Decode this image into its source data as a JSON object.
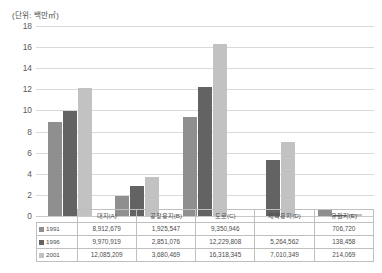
{
  "unit_caption": "(단위: 백만㎡)",
  "chart_data": {
    "type": "bar",
    "title": "",
    "subtitle": "",
    "xlabel": "",
    "ylabel": "",
    "unit": "백만㎡",
    "ylim": [
      0,
      18
    ],
    "ytick_step": 2,
    "yticks": [
      "18",
      "16",
      "14",
      "12",
      "10",
      "8",
      "6",
      "4",
      "2",
      "0"
    ],
    "grid": true,
    "legend_position": "table-row-headers",
    "categories": [
      "대지(A)",
      "공장용지(B)",
      "도로(C)",
      "체육용지(D)",
      "유원지(E)"
    ],
    "series": [
      {
        "name": "1991",
        "color": "#8f8f8f",
        "values": [
          8.912679,
          1.925547,
          9.350946,
          null,
          0.70672
        ],
        "display_values": [
          "8,912,679",
          "1,925,547",
          "9,350,946",
          "",
          "706,720"
        ]
      },
      {
        "name": "1996",
        "color": "#636363",
        "values": [
          9.970919,
          2.851076,
          12.229808,
          5.264562,
          0.138458
        ],
        "display_values": [
          "9,970,919",
          "2,851,076",
          "12,229,808",
          "5,264,562",
          "138,458"
        ]
      },
      {
        "name": "2001",
        "color": "#c2c2c2",
        "values": [
          12.085209,
          3.680469,
          16.318345,
          7.010349,
          0.214069
        ],
        "display_values": [
          "12,085,209",
          "3,680,469",
          "16,318,345",
          "7,010,349",
          "214,069"
        ]
      }
    ]
  },
  "table": {
    "column_headers": [
      "대지(A)",
      "공장용지(B)",
      "도로(C)",
      "체육용지(D)",
      "유원지(E)"
    ],
    "rows": [
      {
        "year": "1991",
        "swatch_class": "s0",
        "cells": [
          "8,912,679",
          "1,925,547",
          "9,350,946",
          "",
          "706,720"
        ]
      },
      {
        "year": "1996",
        "swatch_class": "s1",
        "cells": [
          "9,970,919",
          "2,851,076",
          "12,229,808",
          "5,264,562",
          "138,458"
        ]
      },
      {
        "year": "2001",
        "swatch_class": "s2",
        "cells": [
          "12,085,209",
          "3,680,469",
          "16,318,345",
          "7,010,349",
          "214,069"
        ]
      }
    ]
  }
}
